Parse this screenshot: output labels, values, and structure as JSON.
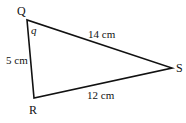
{
  "diagram": {
    "type": "triangle",
    "vertices": {
      "Q": {
        "label": "Q",
        "x": 27,
        "y": 20
      },
      "R": {
        "label": "R",
        "x": 34,
        "y": 98
      },
      "S": {
        "label": "S",
        "x": 172,
        "y": 68
      }
    },
    "sides": {
      "QS": {
        "label": "14 cm"
      },
      "QR": {
        "label": "5 cm"
      },
      "RS": {
        "label": "12 cm"
      }
    },
    "angle": {
      "label": "q",
      "at": "Q"
    },
    "colors": {
      "stroke": "#111111",
      "background": "#ffffff"
    }
  }
}
